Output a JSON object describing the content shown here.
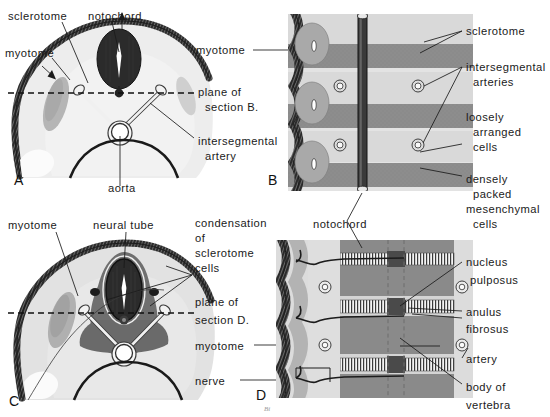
{
  "figure": {
    "signature": "Bi",
    "panels": [
      {
        "id": "A",
        "letter": "A",
        "x": 26,
        "y": 181
      },
      {
        "id": "B",
        "letter": "B",
        "x": 280,
        "y": 181
      },
      {
        "id": "C",
        "letter": "C",
        "x": 9,
        "y": 404
      },
      {
        "id": "D",
        "letter": "D",
        "x": 256,
        "y": 397
      }
    ]
  },
  "colors": {
    "ectoderm_dark": "#2f2f2f",
    "mesenchyme_light": "#e0e0e0",
    "sclerotome_mid": "#b8b8b8",
    "dense_gray": "#8e8e8e",
    "notochord_black": "#262626",
    "background": "#ffffff",
    "leader_line": "#1a1a1a",
    "plane_line": "#111111"
  },
  "labels": {
    "panel_a": [
      {
        "name": "sclerotome",
        "text": "sclerotome",
        "x": 8,
        "y": 16,
        "anchor": "start"
      },
      {
        "name": "notochord",
        "text": "notochord",
        "x": 88,
        "y": 16,
        "anchor": "start"
      },
      {
        "name": "myotome",
        "text": "myotome",
        "x": 5,
        "y": 53,
        "anchor": "start"
      },
      {
        "name": "plane-of-section-b-line1",
        "text": "plane of",
        "x": 198,
        "y": 92,
        "anchor": "start"
      },
      {
        "name": "plane-of-section-b-line2",
        "text": "section B.",
        "x": 205,
        "y": 107,
        "anchor": "start"
      },
      {
        "name": "intersegmental-artery-line1",
        "text": "intersegmental",
        "x": 198,
        "y": 141,
        "anchor": "start"
      },
      {
        "name": "intersegmental-artery-line2",
        "text": "artery",
        "x": 205,
        "y": 156,
        "anchor": "start"
      },
      {
        "name": "aorta",
        "text": "aorta",
        "x": 112,
        "y": 190,
        "anchor": "start"
      },
      {
        "name": "myotome-right",
        "text": "myotome",
        "x": 195,
        "y": 53,
        "anchor": "start"
      }
    ],
    "panel_b": [
      {
        "name": "sclerotome",
        "text": "sclerotome",
        "x": 466,
        "y": 35,
        "anchor": "start"
      },
      {
        "name": "intersegmental-arteries-line1",
        "text": "intersegmental",
        "x": 466,
        "y": 71,
        "anchor": "start"
      },
      {
        "name": "intersegmental-arteries-line2",
        "text": "arteries",
        "x": 473,
        "y": 86,
        "anchor": "start"
      },
      {
        "name": "loosely-arranged-cells-line1",
        "text": "loosely",
        "x": 466,
        "y": 118,
        "anchor": "start"
      },
      {
        "name": "loosely-arranged-cells-line2",
        "text": "arranged",
        "x": 473,
        "y": 133,
        "anchor": "start"
      },
      {
        "name": "loosely-arranged-cells-line3",
        "text": "cells",
        "x": 473,
        "y": 148,
        "anchor": "start"
      },
      {
        "name": "densely-packed-mesenchymal-cells-line1",
        "text": "densely",
        "x": 466,
        "y": 180,
        "anchor": "start"
      },
      {
        "name": "densely-packed-mesenchymal-cells-line2",
        "text": "packed",
        "x": 473,
        "y": 195,
        "anchor": "start"
      },
      {
        "name": "densely-packed-mesenchymal-cells-line3",
        "text": "mesenchymal",
        "x": 466,
        "y": 210,
        "anchor": "start"
      },
      {
        "name": "densely-packed-mesenchymal-cells-line4",
        "text": "cells",
        "x": 473,
        "y": 225,
        "anchor": "start"
      },
      {
        "name": "notochord",
        "text": "notochord",
        "x": 315,
        "y": 226,
        "anchor": "start"
      }
    ],
    "panel_c": [
      {
        "name": "myotome",
        "text": "myotome",
        "x": 8,
        "y": 226,
        "anchor": "start"
      },
      {
        "name": "neural-tube",
        "text": "neural tube",
        "x": 95,
        "y": 226,
        "anchor": "start"
      },
      {
        "name": "condensation-of-sclerotome-cells-line1",
        "text": "condensation",
        "x": 195,
        "y": 224,
        "anchor": "start"
      },
      {
        "name": "condensation-of-sclerotome-cells-line2",
        "text": "of",
        "x": 195,
        "y": 239,
        "anchor": "start"
      },
      {
        "name": "condensation-of-sclerotome-cells-line3",
        "text": "sclerotome",
        "x": 195,
        "y": 254,
        "anchor": "start"
      },
      {
        "name": "condensation-of-sclerotome-cells-line4",
        "text": "cells",
        "x": 195,
        "y": 269,
        "anchor": "start"
      },
      {
        "name": "plane-of-section-d-line1",
        "text": "plane of",
        "x": 195,
        "y": 303,
        "anchor": "start"
      },
      {
        "name": "plane-of-section-d-line2",
        "text": "section D.",
        "x": 195,
        "y": 321,
        "anchor": "start"
      },
      {
        "name": "myotome-right",
        "text": "myotome",
        "x": 195,
        "y": 349,
        "anchor": "start"
      },
      {
        "name": "nerve",
        "text": "nerve",
        "x": 195,
        "y": 384,
        "anchor": "start"
      }
    ],
    "panel_d": [
      {
        "name": "nucleus-pulposus-line1",
        "text": "nucleus",
        "x": 466,
        "y": 266,
        "anchor": "start"
      },
      {
        "name": "nucleus-pulposus-line2",
        "text": "pulposus",
        "x": 470,
        "y": 284,
        "anchor": "start"
      },
      {
        "name": "anulus-fibrosus-line1",
        "text": "anulus",
        "x": 466,
        "y": 315,
        "anchor": "start"
      },
      {
        "name": "anulus-fibrosus-line2",
        "text": "fibrosus",
        "x": 466,
        "y": 332,
        "anchor": "start"
      },
      {
        "name": "artery",
        "text": "artery",
        "x": 466,
        "y": 362,
        "anchor": "start"
      },
      {
        "name": "body-of-vertebra-line1",
        "text": "body of",
        "x": 466,
        "y": 390,
        "anchor": "start"
      },
      {
        "name": "body-of-vertebra-line2",
        "text": "vertebra",
        "x": 466,
        "y": 408,
        "anchor": "start"
      }
    ]
  },
  "structures": {
    "panel_a": [
      "sclerotome",
      "notochord",
      "myotome",
      "intersegmental artery",
      "aorta",
      "plane of section B."
    ],
    "panel_b": [
      "sclerotome",
      "intersegmental arteries",
      "loosely arranged cells",
      "densely packed mesenchymal cells",
      "notochord"
    ],
    "panel_c": [
      "myotome",
      "neural tube",
      "condensation of sclerotome cells",
      "nerve",
      "plane of section D."
    ],
    "panel_d": [
      "nucleus pulposus",
      "anulus fibrosus",
      "artery",
      "body of vertebra",
      "notochord",
      "myotome",
      "nerve"
    ]
  }
}
